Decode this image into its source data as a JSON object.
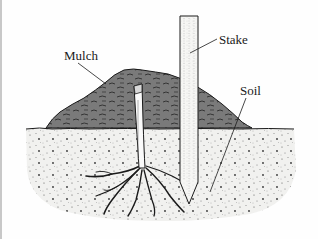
{
  "figure": {
    "labels": {
      "mulch": "Mulch",
      "stake": "Stake",
      "soil": "Soil"
    },
    "colors": {
      "background": "#fefefe",
      "mulch": "#7a7a7a",
      "soil": "#f1f1ef",
      "ink": "#1a1a1a",
      "stake": "#f6f6f4"
    }
  }
}
